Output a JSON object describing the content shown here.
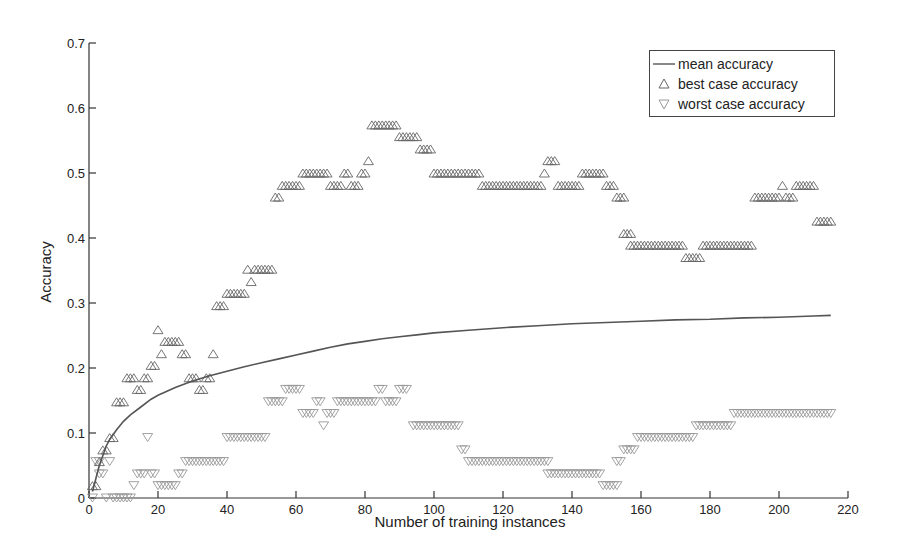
{
  "chart_data": {
    "type": "scatter",
    "title": "",
    "xlabel": "Number of training instances",
    "ylabel": "Accuracy",
    "xlim": [
      0,
      220
    ],
    "ylim": [
      0,
      0.7
    ],
    "x_ticks": [
      0,
      20,
      40,
      60,
      80,
      100,
      120,
      140,
      160,
      180,
      200,
      220
    ],
    "x_tick_labels": [
      "0",
      "20",
      "40",
      "60",
      "80",
      "100",
      "120",
      "140",
      "160",
      "180",
      "200",
      "220"
    ],
    "y_ticks": [
      0,
      0.1,
      0.2,
      0.3,
      0.4,
      0.5,
      0.6,
      0.7
    ],
    "y_tick_labels": [
      "0",
      "0.1",
      "0.2",
      "0.3",
      "0.4",
      "0.5",
      "0.6",
      "0.7"
    ],
    "grid": false,
    "legend_position": "upper right",
    "legend": [
      "mean accuracy",
      "best case accuracy",
      "worst case accuracy"
    ],
    "series": [
      {
        "name": "mean accuracy",
        "style": "line",
        "x": [
          1,
          2,
          3,
          4,
          5,
          6,
          8,
          10,
          12,
          15,
          18,
          20,
          25,
          30,
          35,
          40,
          45,
          50,
          55,
          60,
          65,
          70,
          75,
          80,
          85,
          90,
          95,
          100,
          110,
          120,
          130,
          140,
          150,
          160,
          170,
          180,
          190,
          200,
          210,
          215
        ],
        "values": [
          0.01,
          0.03,
          0.05,
          0.065,
          0.08,
          0.09,
          0.105,
          0.118,
          0.128,
          0.14,
          0.152,
          0.158,
          0.17,
          0.18,
          0.188,
          0.195,
          0.202,
          0.208,
          0.214,
          0.22,
          0.226,
          0.232,
          0.237,
          0.241,
          0.245,
          0.248,
          0.251,
          0.254,
          0.258,
          0.262,
          0.265,
          0.268,
          0.27,
          0.272,
          0.274,
          0.275,
          0.277,
          0.278,
          0.28,
          0.281
        ]
      },
      {
        "name": "best case accuracy",
        "style": "marker",
        "marker": "triangle-up",
        "segments": [
          {
            "from": 1,
            "to": 2,
            "value": 0.019
          },
          {
            "from": 3,
            "to": 3,
            "value": 0.056
          },
          {
            "from": 4,
            "to": 5,
            "value": 0.074
          },
          {
            "from": 6,
            "to": 7,
            "value": 0.093
          },
          {
            "from": 8,
            "to": 10,
            "value": 0.148
          },
          {
            "from": 11,
            "to": 13,
            "value": 0.185
          },
          {
            "from": 14,
            "to": 15,
            "value": 0.167
          },
          {
            "from": 16,
            "to": 17,
            "value": 0.185
          },
          {
            "from": 18,
            "to": 19,
            "value": 0.204
          },
          {
            "from": 20,
            "to": 20,
            "value": 0.259
          },
          {
            "from": 21,
            "to": 21,
            "value": 0.222
          },
          {
            "from": 22,
            "to": 26,
            "value": 0.241
          },
          {
            "from": 27,
            "to": 28,
            "value": 0.222
          },
          {
            "from": 29,
            "to": 31,
            "value": 0.185
          },
          {
            "from": 32,
            "to": 33,
            "value": 0.167
          },
          {
            "from": 34,
            "to": 35,
            "value": 0.185
          },
          {
            "from": 36,
            "to": 36,
            "value": 0.222
          },
          {
            "from": 37,
            "to": 39,
            "value": 0.296
          },
          {
            "from": 40,
            "to": 45,
            "value": 0.315
          },
          {
            "from": 46,
            "to": 46,
            "value": 0.352
          },
          {
            "from": 47,
            "to": 47,
            "value": 0.333
          },
          {
            "from": 48,
            "to": 53,
            "value": 0.352
          },
          {
            "from": 54,
            "to": 55,
            "value": 0.463
          },
          {
            "from": 56,
            "to": 61,
            "value": 0.481
          },
          {
            "from": 62,
            "to": 69,
            "value": 0.5
          },
          {
            "from": 70,
            "to": 73,
            "value": 0.481
          },
          {
            "from": 74,
            "to": 75,
            "value": 0.5
          },
          {
            "from": 76,
            "to": 78,
            "value": 0.481
          },
          {
            "from": 79,
            "to": 80,
            "value": 0.5
          },
          {
            "from": 81,
            "to": 81,
            "value": 0.519
          },
          {
            "from": 82,
            "to": 89,
            "value": 0.574
          },
          {
            "from": 90,
            "to": 95,
            "value": 0.556
          },
          {
            "from": 96,
            "to": 99,
            "value": 0.537
          },
          {
            "from": 100,
            "to": 113,
            "value": 0.5
          },
          {
            "from": 114,
            "to": 131,
            "value": 0.481
          },
          {
            "from": 132,
            "to": 132,
            "value": 0.5
          },
          {
            "from": 133,
            "to": 135,
            "value": 0.519
          },
          {
            "from": 136,
            "to": 142,
            "value": 0.481
          },
          {
            "from": 143,
            "to": 149,
            "value": 0.5
          },
          {
            "from": 150,
            "to": 152,
            "value": 0.481
          },
          {
            "from": 153,
            "to": 155,
            "value": 0.463
          },
          {
            "from": 155,
            "to": 157,
            "value": 0.407
          },
          {
            "from": 157,
            "to": 170,
            "value": 0.389
          },
          {
            "from": 171,
            "to": 172,
            "value": 0.389
          },
          {
            "from": 173,
            "to": 173,
            "value": 0.37
          },
          {
            "from": 174,
            "to": 177,
            "value": 0.37
          },
          {
            "from": 178,
            "to": 192,
            "value": 0.389
          },
          {
            "from": 193,
            "to": 200,
            "value": 0.463
          },
          {
            "from": 201,
            "to": 201,
            "value": 0.481
          },
          {
            "from": 202,
            "to": 204,
            "value": 0.463
          },
          {
            "from": 205,
            "to": 210,
            "value": 0.481
          },
          {
            "from": 211,
            "to": 215,
            "value": 0.426
          }
        ]
      },
      {
        "name": "worst case accuracy",
        "style": "marker",
        "marker": "triangle-down",
        "segments": [
          {
            "from": 1,
            "to": 1,
            "value": 0.0
          },
          {
            "from": 2,
            "to": 3,
            "value": 0.056
          },
          {
            "from": 3,
            "to": 4,
            "value": 0.037
          },
          {
            "from": 5,
            "to": 5,
            "value": 0.0
          },
          {
            "from": 6,
            "to": 6,
            "value": 0.056
          },
          {
            "from": 7,
            "to": 12,
            "value": 0.0
          },
          {
            "from": 13,
            "to": 13,
            "value": 0.019
          },
          {
            "from": 14,
            "to": 16,
            "value": 0.037
          },
          {
            "from": 17,
            "to": 17,
            "value": 0.093
          },
          {
            "from": 18,
            "to": 19,
            "value": 0.037
          },
          {
            "from": 20,
            "to": 25,
            "value": 0.019
          },
          {
            "from": 26,
            "to": 27,
            "value": 0.037
          },
          {
            "from": 28,
            "to": 39,
            "value": 0.056
          },
          {
            "from": 40,
            "to": 51,
            "value": 0.093
          },
          {
            "from": 52,
            "to": 56,
            "value": 0.148
          },
          {
            "from": 57,
            "to": 61,
            "value": 0.167
          },
          {
            "from": 62,
            "to": 65,
            "value": 0.13
          },
          {
            "from": 66,
            "to": 67,
            "value": 0.148
          },
          {
            "from": 68,
            "to": 68,
            "value": 0.111
          },
          {
            "from": 69,
            "to": 71,
            "value": 0.13
          },
          {
            "from": 72,
            "to": 83,
            "value": 0.148
          },
          {
            "from": 84,
            "to": 85,
            "value": 0.167
          },
          {
            "from": 86,
            "to": 89,
            "value": 0.148
          },
          {
            "from": 90,
            "to": 92,
            "value": 0.167
          },
          {
            "from": 94,
            "to": 107,
            "value": 0.111
          },
          {
            "from": 108,
            "to": 109,
            "value": 0.074
          },
          {
            "from": 110,
            "to": 133,
            "value": 0.056
          },
          {
            "from": 133,
            "to": 148,
            "value": 0.037
          },
          {
            "from": 149,
            "to": 153,
            "value": 0.019
          },
          {
            "from": 153,
            "to": 154,
            "value": 0.056
          },
          {
            "from": 155,
            "to": 158,
            "value": 0.074
          },
          {
            "from": 159,
            "to": 175,
            "value": 0.093
          },
          {
            "from": 176,
            "to": 186,
            "value": 0.111
          },
          {
            "from": 187,
            "to": 215,
            "value": 0.13
          }
        ]
      }
    ]
  },
  "legend": {
    "items": [
      {
        "label": "mean accuracy",
        "symbol": "line"
      },
      {
        "label": "best case accuracy",
        "symbol": "triangle-up"
      },
      {
        "label": "worst case accuracy",
        "symbol": "triangle-down"
      }
    ]
  },
  "axes": {
    "xlabel": "Number of training instances",
    "ylabel": "Accuracy"
  },
  "colors": {
    "axis": "#333333",
    "mean_line": "#555555",
    "best_marker": "#666666",
    "worst_marker": "#999999",
    "background": "#ffffff"
  }
}
